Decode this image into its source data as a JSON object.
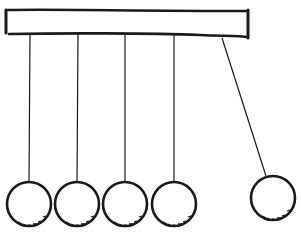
{
  "illustration": {
    "subject": "Newton's cradle sketch",
    "ball_count": 5,
    "resting_balls": 4,
    "swinging_balls": 1,
    "line_color": "#1a1a1a",
    "background_color": "#ffffff"
  }
}
